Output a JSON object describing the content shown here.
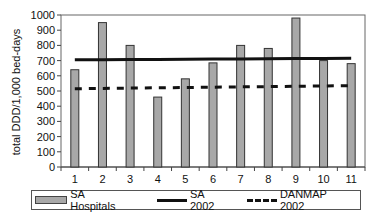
{
  "chart_data": {
    "type": "bar",
    "title": "",
    "xlabel": "",
    "ylabel": "total DDD/1,000 bed-days",
    "ylim": [
      0,
      1000
    ],
    "yticks": [
      0,
      100,
      200,
      300,
      400,
      500,
      600,
      700,
      800,
      900,
      1000
    ],
    "categories": [
      "1",
      "2",
      "3",
      "4",
      "5",
      "6",
      "7",
      "8",
      "9",
      "10",
      "11"
    ],
    "series": [
      {
        "name": "SA Hospitals",
        "type": "bar",
        "color": "#a8a8a8",
        "values": [
          640,
          950,
          800,
          460,
          580,
          685,
          800,
          780,
          980,
          700,
          680
        ]
      },
      {
        "name": "SA 2002",
        "type": "line",
        "style": "solid",
        "color": "#111111",
        "values": [
          705,
          706,
          707,
          708,
          709,
          710,
          711,
          712,
          713,
          714,
          715
        ]
      },
      {
        "name": "DANMAP 2002",
        "type": "line",
        "style": "dashed",
        "color": "#111111",
        "values": [
          515,
          517,
          519,
          521,
          523,
          525,
          527,
          529,
          531,
          533,
          535
        ]
      }
    ],
    "grid": false,
    "legend_position": "bottom"
  },
  "legend": {
    "items": [
      {
        "label": "SA Hospitals"
      },
      {
        "label": "SA 2002"
      },
      {
        "label": "DANMAP 2002"
      }
    ]
  }
}
